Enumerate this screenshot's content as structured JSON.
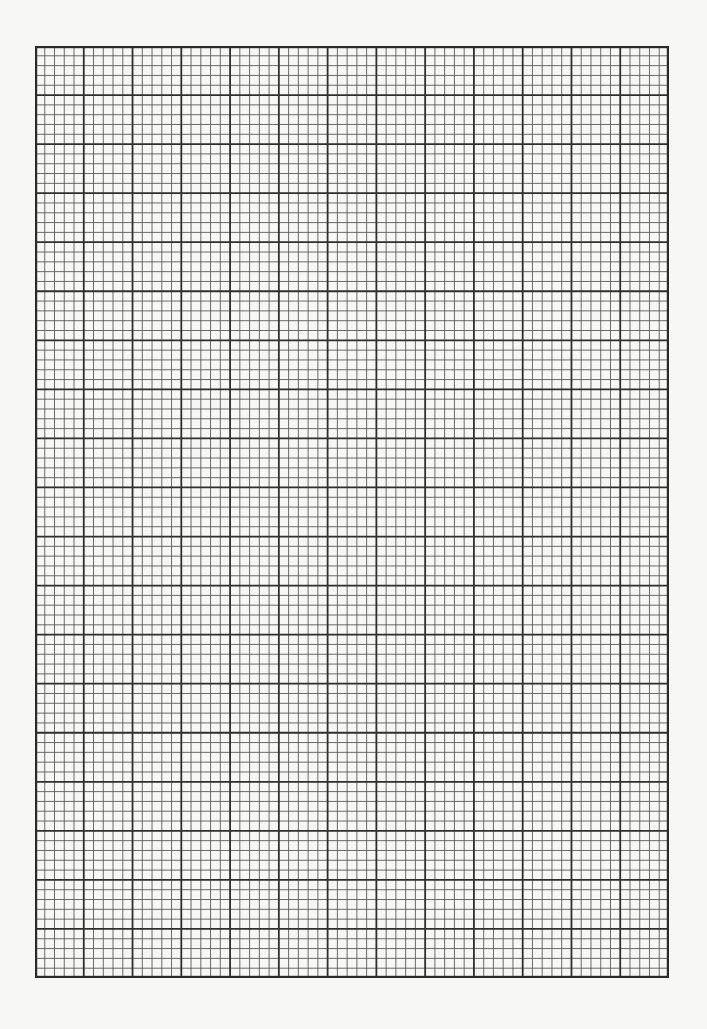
{
  "page": {
    "type": "graph-paper",
    "background_color": "#f7f7f6"
  },
  "grid": {
    "left": 35,
    "top": 46,
    "width": 634,
    "height": 932,
    "major_columns": 13,
    "major_rows": 19,
    "minor_per_major": 5,
    "major_line_color": "#2f2f2f",
    "minor_line_color": "#5a5a5a",
    "border_color": "#2a2a2a",
    "major_line_width": 1.8,
    "minor_line_width": 0.9,
    "border_line_width": 2.2
  }
}
